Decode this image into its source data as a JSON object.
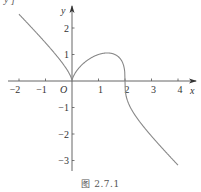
{
  "chart_data": {
    "type": "line",
    "title": "",
    "caption": "图 2.7.1",
    "xlabel": "x",
    "ylabel": "y",
    "origin_label": "O",
    "function": "y = ∛(x²(2−x))",
    "xlim": [
      -2.2,
      4.6
    ],
    "ylim": [
      -3.4,
      3.0
    ],
    "x_ticks": [
      -2,
      -1,
      1,
      2,
      3,
      4
    ],
    "y_ticks": [
      -3,
      -2,
      -1,
      1,
      2
    ],
    "x_tick_labels": [
      "−2",
      "−1",
      "1",
      "2",
      "3",
      "4"
    ],
    "y_tick_labels": [
      "−3",
      "−2",
      "−1",
      "1",
      "2"
    ],
    "grid": false,
    "legend": null,
    "series": [
      {
        "name": "f(x)",
        "color": "#888888",
        "x": [
          -2,
          -1.5,
          -1,
          -0.5,
          -0.2,
          0,
          0.2,
          0.5,
          0.8,
          1,
          1.333,
          1.6,
          1.8,
          1.9,
          2,
          2.1,
          2.5,
          3,
          3.5,
          4
        ],
        "y": [
          2.52,
          1.99,
          1.44,
          0.86,
          0.42,
          0,
          0.42,
          0.72,
          0.91,
          1.0,
          1.06,
          1.01,
          0.87,
          0.71,
          0,
          -0.76,
          -1.46,
          -2.08,
          -2.64,
          -3.17
        ]
      }
    ],
    "annotations": [
      "O"
    ]
  },
  "topleft_fragment": "y ]"
}
